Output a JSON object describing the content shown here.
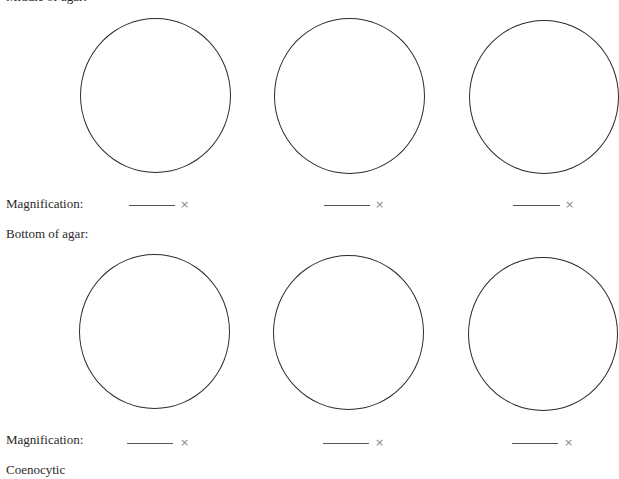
{
  "sections": {
    "middle": {
      "heading": "Middle of agar:",
      "magnification_label": "Magnification:",
      "fields": [
        {
          "value": "",
          "unit": "×"
        },
        {
          "value": "",
          "unit": "×"
        },
        {
          "value": "",
          "unit": "×"
        }
      ],
      "circle_count": 3
    },
    "bottom": {
      "heading": "Bottom of agar:",
      "magnification_label": "Magnification:",
      "fields": [
        {
          "value": "",
          "unit": "×"
        },
        {
          "value": "",
          "unit": "×"
        },
        {
          "value": "",
          "unit": "×"
        }
      ],
      "circle_count": 3
    }
  },
  "footer": {
    "next_heading": "Coenocytic"
  },
  "colors": {
    "circle_stroke": "#2b2b2b",
    "text": "#2a2a2a",
    "unit_symbol": "#8a8a8a"
  }
}
